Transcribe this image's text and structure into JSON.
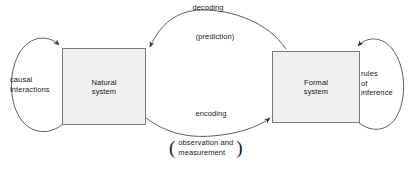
{
  "diagram": {
    "stroke_color": "#4d4d4d",
    "box_fill_color": "#f0f0f0",
    "box_border_color": "#7a7a7a",
    "text_color": "#1a1a1a",
    "background_color": "#ffffff"
  },
  "nodes": [
    {
      "id": "natural-system",
      "label": "Natural\nsystem"
    },
    {
      "id": "formal-system",
      "label": "Formal\nsystem"
    }
  ],
  "edges": [
    {
      "id": "decoding",
      "label": "decoding",
      "sublabel": "(prediction)",
      "from": "formal-system",
      "to": "natural-system",
      "direction": "right-to-left",
      "position": "top"
    },
    {
      "id": "encoding",
      "label": "encoding",
      "sublabel": "observation and\nmeasurement",
      "sublabel_open_paren": "(",
      "sublabel_close_paren": ")",
      "from": "natural-system",
      "to": "formal-system",
      "direction": "left-to-right",
      "position": "bottom"
    },
    {
      "id": "causal-interactions",
      "label": "causal\ninteractions",
      "from": "natural-system",
      "to": "natural-system",
      "direction": "self-loop",
      "position": "left"
    },
    {
      "id": "rules-of-inference",
      "label": "rules\nof\ninference",
      "from": "formal-system",
      "to": "formal-system",
      "direction": "self-loop",
      "position": "right"
    }
  ]
}
